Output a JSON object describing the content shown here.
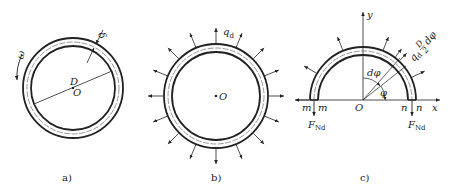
{
  "panels": {
    "a": {
      "caption": "a)",
      "omega": "ω",
      "delta": "δ",
      "diameter": "D",
      "center": "O"
    },
    "b": {
      "caption": "b)",
      "load": "q",
      "load_sub": "d",
      "center": "O"
    },
    "c": {
      "caption": "c)",
      "y_axis": "y",
      "x_axis": "x",
      "origin": "O",
      "dphi": "dφ",
      "phi": "φ",
      "m_left": "m",
      "m_right": "m",
      "n_left": "n",
      "n_right": "n",
      "force_left": "F",
      "force_left_sub": "Nd",
      "force_right": "F",
      "force_right_sub": "Nd",
      "element_load": "q",
      "element_load_sub": "d",
      "element_frac_num": "D",
      "element_frac_den": "2",
      "element_dphi": "dφ"
    }
  },
  "colors": {
    "stroke": "#222222",
    "background": "#ffffff"
  }
}
